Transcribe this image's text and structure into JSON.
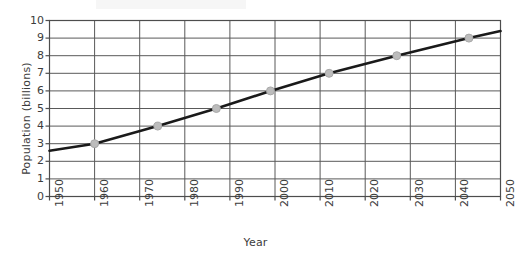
{
  "chart_data": {
    "type": "line",
    "title": "",
    "xlabel": "Year",
    "ylabel": "Population (billions)",
    "xlim": [
      1950,
      2050
    ],
    "ylim": [
      0,
      10
    ],
    "grid": true,
    "legend": "none",
    "xticks": [
      1950,
      1960,
      1970,
      1980,
      1990,
      2000,
      2010,
      2020,
      2030,
      2040,
      2050
    ],
    "xticklabels": [
      "1950",
      "1960",
      "1970",
      "1980",
      "1990",
      "2000",
      "2010",
      "2020",
      "2030",
      "2040",
      "2050"
    ],
    "yticks": [
      0,
      1,
      2,
      3,
      4,
      5,
      6,
      7,
      8,
      9,
      10
    ],
    "yticklabels": [
      "0",
      "1",
      "2",
      "3",
      "4",
      "5",
      "6",
      "7",
      "8",
      "9",
      "10"
    ],
    "line": {
      "name": "World population",
      "color": "#1a1a1a",
      "width": 2.6,
      "x": [
        1950,
        1960,
        1974,
        1987,
        1999,
        2012,
        2027,
        2043,
        2050
      ],
      "y": [
        2.6,
        3.0,
        4.0,
        5.0,
        6.0,
        7.0,
        8.0,
        9.0,
        9.4
      ]
    },
    "markers": {
      "color": "#bcbcbc",
      "edge_color": "#a8a8a8",
      "radius": 4,
      "points": [
        {
          "x": 1960,
          "y": 3.0
        },
        {
          "x": 1974,
          "y": 4.0
        },
        {
          "x": 1987,
          "y": 5.0
        },
        {
          "x": 1999,
          "y": 6.0
        },
        {
          "x": 2012,
          "y": 7.0
        },
        {
          "x": 2027,
          "y": 8.0
        },
        {
          "x": 2043,
          "y": 9.0
        }
      ]
    },
    "axis_color": "#4d4d4d",
    "grid_color": "#595959"
  }
}
